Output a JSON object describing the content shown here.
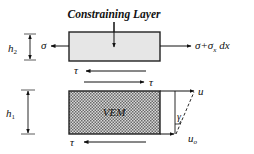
{
  "diagram": {
    "title": "Constraining Layer",
    "constraining_layer": {
      "thickness_label": "h",
      "thickness_sub": "2",
      "left_force": "σ",
      "right_force": "σ+σ",
      "right_force_sub": "x",
      "right_force_tail": " dx",
      "fill_color": "#e6e6e6"
    },
    "interface": {
      "shear_top": "τ",
      "shear_bottom": "τ"
    },
    "vem_layer": {
      "label": "VEM",
      "thickness_label": "h",
      "thickness_sub": "1",
      "shear_bottom": "τ",
      "fill_color": "#9a9a9a"
    },
    "deformation": {
      "top_displacement": "u",
      "bottom_displacement": "u",
      "bottom_displacement_sub": "o",
      "shear_angle": "γ"
    }
  }
}
